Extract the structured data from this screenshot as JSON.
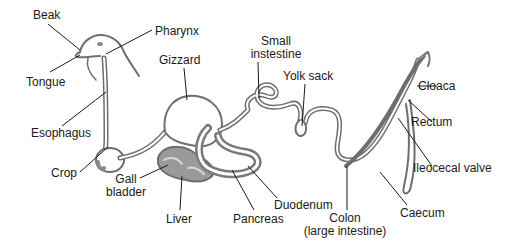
{
  "colors": {
    "outline": "#6e6e6e",
    "fill_dark": "#8a8a8a",
    "leader": "#1a1a1a",
    "text": "#1a1a1a"
  },
  "labels": {
    "beak": "Beak",
    "pharynx": "Pharynx",
    "tongue": "Tongue",
    "gizzard": "Gizzard",
    "small_intestine_1": "Small",
    "small_intestine_2": "instestine",
    "yolk_sack": "Yolk sack",
    "cloaca": "Cloaca",
    "rectum": "Rectum",
    "esophagus": "Esophagus",
    "crop": "Crop",
    "gall_bladder_1": "Gall",
    "gall_bladder_2": "bladder",
    "liver": "Liver",
    "pancreas": "Pancreas",
    "duodenum": "Duodenum",
    "colon_1": "Colon",
    "colon_2": "(large intestine)",
    "ileocecal_valve": "Ileocecal valve",
    "caecum": "Caecum"
  }
}
